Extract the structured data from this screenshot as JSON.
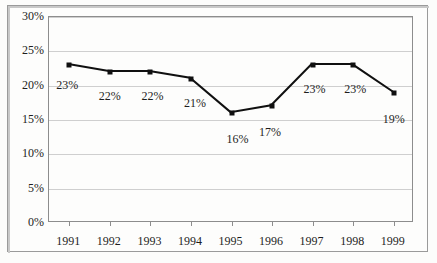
{
  "chart_data": {
    "type": "line",
    "title": "",
    "subtitle": "",
    "xlabel": "",
    "ylabel": "",
    "categories": [
      "1991",
      "1992",
      "1993",
      "1994",
      "1995",
      "1996",
      "1997",
      "1998",
      "1999"
    ],
    "values": [
      23,
      22,
      22,
      21,
      16,
      17,
      23,
      23,
      19
    ],
    "point_labels": [
      "23%",
      "22%",
      "22%",
      "21%",
      "16%",
      "17%",
      "23%",
      "23%",
      "19%"
    ],
    "ylim": [
      0,
      30
    ],
    "y_ticks": [
      0,
      5,
      10,
      15,
      20,
      25,
      30
    ],
    "y_tick_labels": [
      "0%",
      "5%",
      "10%",
      "15%",
      "20%",
      "25%",
      "30%"
    ],
    "grid": true,
    "legend": "none",
    "series": [
      {
        "name": "series-1",
        "values": [
          23,
          22,
          22,
          21,
          16,
          17,
          23,
          23,
          19
        ],
        "line_color": "#101010",
        "marker_color": "#101010",
        "marker": "square"
      }
    ],
    "colors": {
      "line": "#101010",
      "marker": "#101010",
      "gridline": "#cfcfcf",
      "plot_border": "#8d8d8d",
      "outer_border": "#9a9a9a",
      "background": "#fcfcfb",
      "text": "#1d1d1d"
    }
  }
}
